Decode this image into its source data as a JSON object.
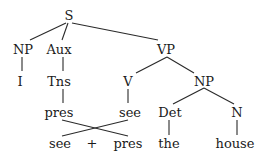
{
  "tree": {
    "nodes": {
      "S": "S",
      "NP1": "NP",
      "Aux": "Aux",
      "VP": "VP",
      "I": "I",
      "Tns": "Tns",
      "V": "V",
      "NP2": "NP",
      "pres1": "pres",
      "see1": "see",
      "Det": "Det",
      "N": "N",
      "see2": "see",
      "plus": "+",
      "pres2": "pres",
      "the": "the",
      "house": "house"
    }
  }
}
